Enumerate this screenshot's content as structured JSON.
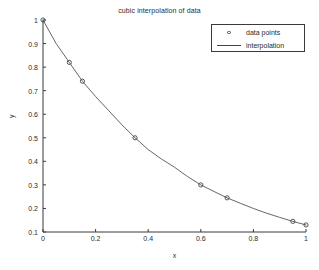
{
  "chart_data": {
    "type": "line",
    "title": "cubic interpolation of data",
    "xlabel": "x",
    "ylabel": "y",
    "xlim": [
      0,
      1
    ],
    "ylim": [
      0.1,
      1
    ],
    "grid": false,
    "legend_position": "top-right",
    "xticks": [
      "0",
      "0.2",
      "0.4",
      "0.6",
      "0.8",
      "1"
    ],
    "xtick_values": [
      0,
      0.2,
      0.4,
      0.6,
      0.8,
      1
    ],
    "yticks": [
      "0.1",
      "0.2",
      "0.3",
      "0.4",
      "0.5",
      "0.6",
      "0.7",
      "0.8",
      "0.9",
      "1"
    ],
    "ytick_values": [
      0.1,
      0.2,
      0.3,
      0.4,
      0.5,
      0.6,
      0.7,
      0.8,
      0.9,
      1
    ],
    "series": [
      {
        "name": "data points",
        "marker": "circle",
        "x": [
          0,
          0.1,
          0.15,
          0.35,
          0.6,
          0.7,
          0.95,
          1
        ],
        "values": [
          1.0,
          0.82,
          0.74,
          0.5,
          0.3,
          0.245,
          0.145,
          0.13
        ]
      },
      {
        "name": "interpolation",
        "marker": "line",
        "x": [
          0,
          0.05,
          0.1,
          0.15,
          0.2,
          0.25,
          0.3,
          0.35,
          0.4,
          0.45,
          0.5,
          0.55,
          0.6,
          0.65,
          0.7,
          0.75,
          0.8,
          0.85,
          0.9,
          0.95,
          1
        ],
        "values": [
          1.0,
          0.9,
          0.82,
          0.74,
          0.675,
          0.615,
          0.555,
          0.5,
          0.45,
          0.41,
          0.375,
          0.335,
          0.3,
          0.272,
          0.245,
          0.222,
          0.2,
          0.18,
          0.162,
          0.145,
          0.13
        ]
      }
    ]
  },
  "legend": {
    "items": [
      {
        "label": "data points",
        "symbol": "circle-marker"
      },
      {
        "label": "interpolation",
        "symbol": "line-marker"
      }
    ]
  },
  "colors": {
    "axis": "#3a3a3a",
    "curve": "#555555",
    "marker": "#444444",
    "text": "#2b2b2b",
    "background": "#ffffff"
  }
}
